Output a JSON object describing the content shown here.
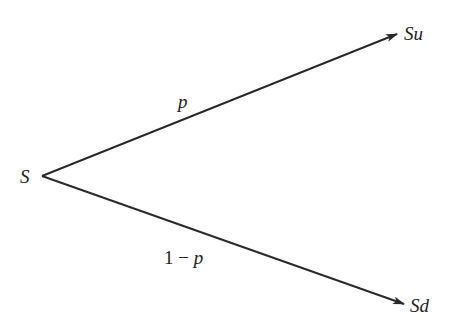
{
  "diagram": {
    "type": "binomial-tree-one-step",
    "root": {
      "label": "S"
    },
    "branches": [
      {
        "target_label": "Su",
        "probability_label": "p"
      },
      {
        "target_label": "Sd",
        "probability_label_num": "1",
        "probability_label_op": "−",
        "probability_label_var": "p"
      }
    ],
    "colors": {
      "line": "#2a2a2a",
      "text": "#222222",
      "background": "#ffffff"
    }
  }
}
